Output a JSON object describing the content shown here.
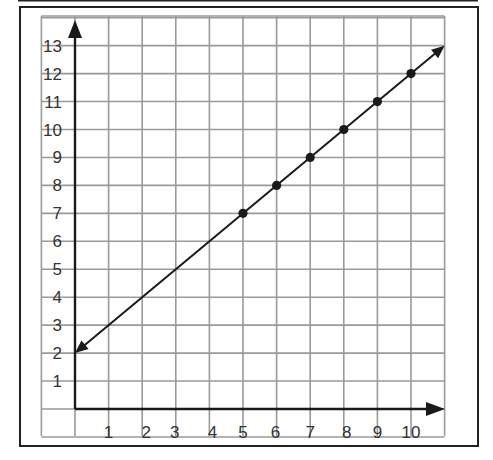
{
  "figure": {
    "frame": "bordered-graph-paper",
    "grid_color": "#9a9a9a",
    "axis_color": "#1a1a1a",
    "line_color": "#1a1a1a",
    "point_color": "#1a1a1a",
    "label_color": "#333333"
  },
  "chart_data": {
    "type": "line",
    "title": "",
    "xlabel": "",
    "ylabel": "",
    "x_tick_labels": [
      "1",
      "2",
      "3",
      "4",
      "5",
      "6",
      "7",
      "8",
      "9",
      "10"
    ],
    "y_tick_labels": [
      "1",
      "2",
      "3",
      "4",
      "5",
      "6",
      "7",
      "8",
      "9",
      "10",
      "11",
      "12",
      "13"
    ],
    "xlim": [
      -1,
      11
    ],
    "ylim": [
      -1,
      14
    ],
    "grid": true,
    "legend": null,
    "series": [
      {
        "name": "line",
        "style": "straight line with arrows at both ends",
        "equation": "y = x + 2",
        "start": {
          "x": 0,
          "y": 2
        },
        "end": {
          "x": 11,
          "y": 13
        },
        "points": [
          {
            "x": 5,
            "y": 7
          },
          {
            "x": 6,
            "y": 8
          },
          {
            "x": 7,
            "y": 9
          },
          {
            "x": 8,
            "y": 10
          },
          {
            "x": 9,
            "y": 11
          },
          {
            "x": 10,
            "y": 12
          }
        ]
      }
    ]
  }
}
